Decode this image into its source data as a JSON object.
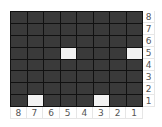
{
  "board": {
    "rows": 8,
    "cols": 8,
    "row_labels": [
      "8",
      "7",
      "6",
      "5",
      "4",
      "3",
      "2",
      "1"
    ],
    "col_labels": [
      "8",
      "7",
      "6",
      "5",
      "4",
      "3",
      "2",
      "1"
    ],
    "cells": [
      [
        0,
        0,
        0,
        0,
        0,
        0,
        0,
        0
      ],
      [
        0,
        0,
        0,
        0,
        0,
        0,
        0,
        0
      ],
      [
        0,
        0,
        0,
        0,
        0,
        0,
        0,
        0
      ],
      [
        0,
        0,
        0,
        1,
        0,
        0,
        0,
        1
      ],
      [
        0,
        0,
        0,
        0,
        0,
        0,
        0,
        0
      ],
      [
        0,
        0,
        0,
        0,
        0,
        0,
        0,
        0
      ],
      [
        0,
        0,
        0,
        0,
        0,
        0,
        0,
        0
      ],
      [
        0,
        1,
        0,
        0,
        0,
        1,
        0,
        0
      ]
    ],
    "colors": {
      "off": "#3a3a3a",
      "on": "#f2f2f2",
      "grid": "#111111"
    }
  }
}
